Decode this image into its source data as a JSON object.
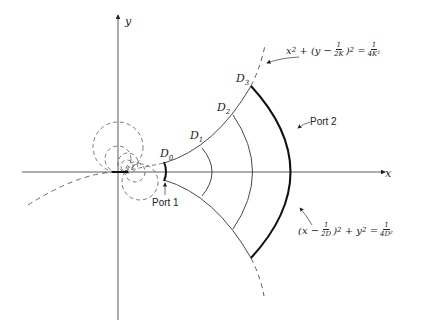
{
  "figure": {
    "axes": {
      "x_label": "x",
      "y_label": "y"
    },
    "boundary_labels": [
      {
        "id": "D0",
        "text": "D",
        "sub": "0"
      },
      {
        "id": "D1",
        "text": "D",
        "sub": "1"
      },
      {
        "id": "D2",
        "text": "D",
        "sub": "2"
      },
      {
        "id": "D3",
        "text": "D",
        "sub": "3"
      }
    ],
    "ports": {
      "port1": "Port 1",
      "port2": "Port 2"
    },
    "equations": {
      "upper": {
        "lhs_a": "x",
        "sq": "2",
        "plus": "+",
        "paren_open": "(y −",
        "num": "1",
        "den": "2K",
        "paren_close": ")",
        "eq": "=",
        "rhs_num": "1",
        "rhs_den": "4K²"
      },
      "lower": {
        "paren_open": "(x −",
        "num": "1",
        "den": "2D",
        "paren_close": ")",
        "sq": "2",
        "plus": "+ y",
        "sq2": "2",
        "eq": "=",
        "rhs_num": "1",
        "rhs_den": "4D²"
      }
    },
    "colors": {
      "stroke": "#222222",
      "background": "#ffffff"
    }
  }
}
